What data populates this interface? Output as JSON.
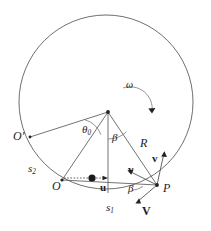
{
  "figure": {
    "background_color": "#ffffff",
    "stroke_color": "#4a4a4a",
    "label_color": "#1d1d1d"
  },
  "labels": {
    "origin_prime": "O",
    "origin_prime_mark": "′",
    "origin": "O",
    "contact_point": "P",
    "radius": "R",
    "angular_velocity": "ω",
    "theta_zero_main": "θ",
    "theta_zero_sub": "0",
    "beta_upper": "β",
    "beta_lower": "β",
    "arc_s1_main": "s",
    "arc_s1_sub": "1",
    "arc_s2_main": "s",
    "arc_s2_sub": "2",
    "vector_u": "u",
    "vector_v_left": "v",
    "vector_v_up": "v",
    "vector_V_lower": "V"
  },
  "geometry": {
    "circle": {
      "cx": 106,
      "cy": 102,
      "r": 87
    },
    "nodes": {
      "apex": {
        "x": 108,
        "y": 112,
        "name": "center-vertex"
      },
      "point_P": {
        "x": 157,
        "y": 185,
        "name": "contact-point-P"
      },
      "point_O": {
        "x": 62,
        "y": 180,
        "name": "point-O"
      },
      "point_Oprime": {
        "x": 30,
        "y": 137,
        "name": "point-O-prime"
      },
      "particle": {
        "x": 92,
        "y": 178,
        "name": "particle-dot"
      }
    },
    "angles": {
      "theta_zero_deg": 38,
      "beta_upper_deg": 26,
      "beta_lower_deg": 22
    },
    "rotation_sense": "clockwise"
  },
  "vectors": [
    {
      "name": "u",
      "from": "point-O-horizontal",
      "direction": "right",
      "style": "bold"
    },
    {
      "name": "v",
      "from": "contact-point-P",
      "direction": "up-left",
      "style": "bold"
    },
    {
      "name": "v",
      "from": "contact-point-P",
      "direction": "up-right",
      "style": "bold"
    },
    {
      "name": "V",
      "from": "contact-point-P",
      "direction": "down-left",
      "style": "bold"
    }
  ]
}
